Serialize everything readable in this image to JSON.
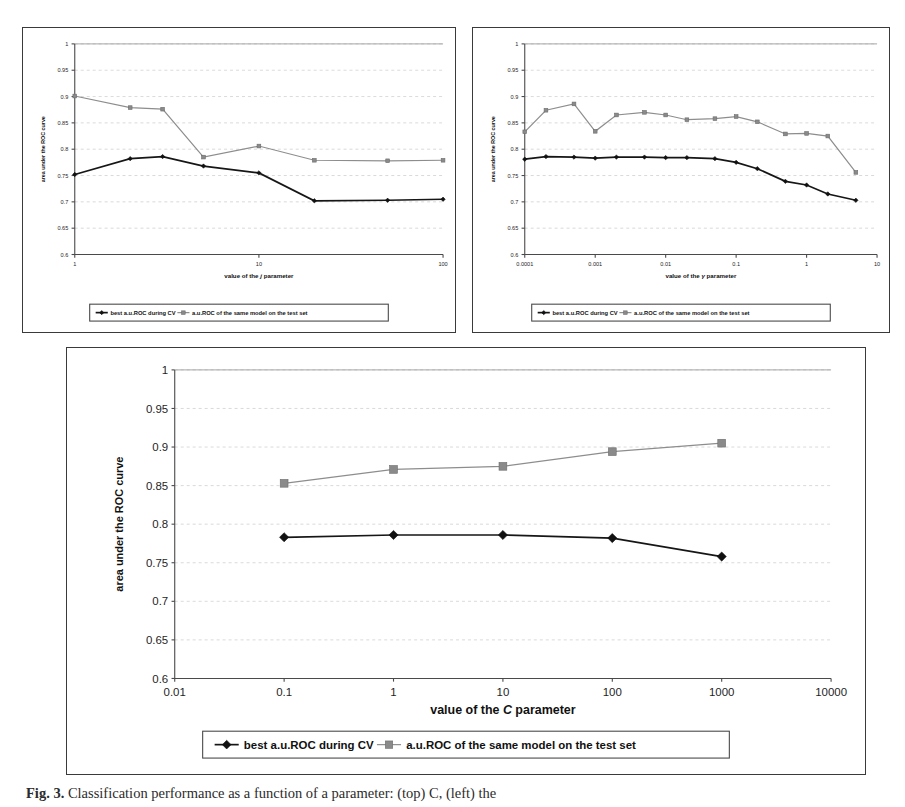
{
  "figure": {
    "caption_label": "Fig. 3.",
    "caption_text": "Classification performance as a function of a parameter: (top) C, (left) the",
    "caption_italic_symbol": "C"
  },
  "legend": {
    "cv_label": "best a.u.ROC during CV",
    "test_label": "a.u.ROC of the same model on the test set",
    "cv_marker": "diamond-marker",
    "test_marker": "square-marker"
  },
  "colors": {
    "cv_series": "#161616",
    "test_series": "#8d8d8d",
    "axis": "#4a4a4a",
    "grid": "#c9c9c9",
    "frame": "#3a3a3a"
  },
  "chart_data": [
    {
      "id": "chart-top-left",
      "type": "line",
      "title": "",
      "xlabel_prefix": "value of the",
      "xlabel_symbol": "j",
      "xlabel_suffix": "parameter",
      "ylabel": "area under the ROC curve",
      "xscale": "log",
      "xlim": [
        1,
        100
      ],
      "ylim": [
        0.6,
        1
      ],
      "yticks": [
        0.6,
        0.65,
        0.7,
        0.75,
        0.8,
        0.85,
        0.9,
        0.95,
        1
      ],
      "ytick_labels": [
        "0.6",
        "0.65",
        "0.7",
        "0.75",
        "0.8",
        "0.85",
        "0.9",
        "0.95",
        "1"
      ],
      "xticks": [
        1,
        10,
        100
      ],
      "xtick_labels": [
        "1",
        "10",
        "100"
      ],
      "grid": true,
      "legend_position": "below",
      "x": [
        1,
        2,
        3,
        5,
        10,
        20,
        50,
        100
      ],
      "series": [
        {
          "name": "best a.u.ROC during CV",
          "marker": "diamond",
          "values": [
            0.752,
            0.782,
            0.786,
            0.768,
            0.755,
            0.702,
            0.703,
            0.705
          ]
        },
        {
          "name": "a.u.ROC of the same model on the test set",
          "marker": "square",
          "values": [
            0.901,
            0.879,
            0.876,
            0.785,
            0.806,
            0.779,
            0.778,
            0.779
          ]
        }
      ]
    },
    {
      "id": "chart-top-right",
      "type": "line",
      "title": "",
      "xlabel_prefix": "value of the",
      "xlabel_symbol": "γ",
      "xlabel_suffix": "parameter",
      "ylabel": "area under the ROC curve",
      "xscale": "log",
      "xlim": [
        0.0001,
        10
      ],
      "ylim": [
        0.6,
        1
      ],
      "yticks": [
        0.6,
        0.65,
        0.7,
        0.75,
        0.8,
        0.85,
        0.9,
        0.95,
        1
      ],
      "ytick_labels": [
        "0.6",
        "0.65",
        "0.7",
        "0.75",
        "0.8",
        "0.85",
        "0.9",
        "0.95",
        "1"
      ],
      "xticks": [
        0.0001,
        0.001,
        0.01,
        0.1,
        1,
        10
      ],
      "xtick_labels": [
        "0.0001",
        "0.001",
        "0.01",
        "0.1",
        "1",
        "10"
      ],
      "grid": true,
      "legend_position": "below",
      "x": [
        0.0001,
        0.0002,
        0.0005,
        0.001,
        0.002,
        0.005,
        0.01,
        0.02,
        0.05,
        0.1,
        0.2,
        0.5,
        1,
        2,
        5
      ],
      "series": [
        {
          "name": "best a.u.ROC during CV",
          "marker": "diamond",
          "values": [
            0.781,
            0.786,
            0.785,
            0.783,
            0.785,
            0.785,
            0.784,
            0.784,
            0.782,
            0.775,
            0.763,
            0.739,
            0.732,
            0.715,
            0.703
          ]
        },
        {
          "name": "a.u.ROC of the same model on the test set",
          "marker": "square",
          "values": [
            0.833,
            0.874,
            0.886,
            0.834,
            0.865,
            0.87,
            0.865,
            0.856,
            0.858,
            0.862,
            0.852,
            0.829,
            0.83,
            0.825,
            0.756
          ]
        }
      ]
    },
    {
      "id": "chart-bottom",
      "type": "line",
      "title": "",
      "xlabel_prefix": "value of the",
      "xlabel_symbol": "C",
      "xlabel_suffix": "parameter",
      "ylabel": "area under the ROC curve",
      "xscale": "log",
      "xlim": [
        0.01,
        10000
      ],
      "ylim": [
        0.6,
        1
      ],
      "yticks": [
        0.6,
        0.65,
        0.7,
        0.75,
        0.8,
        0.85,
        0.9,
        0.95,
        1
      ],
      "ytick_labels": [
        "0.6",
        "0.65",
        "0.7",
        "0.75",
        "0.8",
        "0.85",
        "0.9",
        "0.95",
        "1"
      ],
      "xticks": [
        0.01,
        0.1,
        1,
        10,
        100,
        1000,
        10000
      ],
      "xtick_labels": [
        "0.01",
        "0.1",
        "1",
        "10",
        "100",
        "1000",
        "10000"
      ],
      "grid": true,
      "legend_position": "below",
      "x": [
        0.1,
        1,
        10,
        100,
        1000
      ],
      "series": [
        {
          "name": "best a.u.ROC during CV",
          "marker": "diamond",
          "values": [
            0.783,
            0.786,
            0.786,
            0.782,
            0.758
          ]
        },
        {
          "name": "a.u.ROC of the same model on the test set",
          "marker": "square",
          "values": [
            0.853,
            0.871,
            0.875,
            0.894,
            0.905
          ]
        }
      ]
    }
  ]
}
